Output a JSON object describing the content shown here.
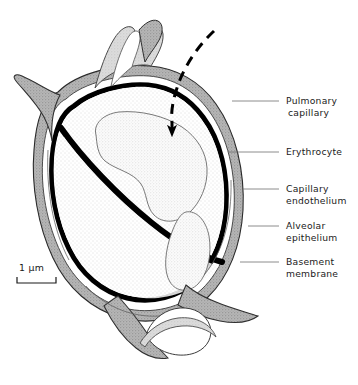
{
  "figure": {
    "kind": "anatomical-diagram",
    "background_color": "#ffffff"
  },
  "colors": {
    "ink": "#111111",
    "basement_membrane": "#000000",
    "tissue_grey": "#a9a9a9",
    "tissue_grey_light": "#c9c9c9",
    "lumen_stipple": "#e9e9e9",
    "erythrocyte_stipple": "#efefef",
    "leader_line": "#6e6e6e",
    "text": "#1a1a1a"
  },
  "labels": [
    {
      "id": "pulmonary-capillary",
      "lines": [
        "Pulmonary",
        "capillary"
      ],
      "text_x": 286,
      "text_y": 104,
      "leader": {
        "x1": 279,
        "y1": 101,
        "x2": 232,
        "y2": 101
      }
    },
    {
      "id": "erythrocyte",
      "lines": [
        "Erythrocyte"
      ],
      "text_x": 286,
      "text_y": 155,
      "leader": {
        "x1": 279,
        "y1": 152,
        "x2": 228,
        "y2": 152
      }
    },
    {
      "id": "capillary-endothelium",
      "lines": [
        "Capillary",
        "endothelium"
      ],
      "text_x": 286,
      "text_y": 192,
      "leader": {
        "x1": 279,
        "y1": 189,
        "x2": 243,
        "y2": 189
      }
    },
    {
      "id": "alveolar-epithelium",
      "lines": [
        "Alveolar",
        "epithelium"
      ],
      "text_x": 286,
      "text_y": 229,
      "leader": {
        "x1": 279,
        "y1": 226,
        "x2": 248,
        "y2": 226
      }
    },
    {
      "id": "basement-membrane",
      "lines": [
        "Basement",
        "membrane"
      ],
      "text_x": 286,
      "text_y": 265,
      "leader": {
        "x1": 279,
        "y1": 262,
        "x2": 240,
        "y2": 262
      }
    }
  ],
  "scale_bar": {
    "label": "1 μm",
    "label_x": 19,
    "label_y": 271,
    "bar_x1": 17,
    "bar_x2": 56,
    "bar_y": 283,
    "tick_height": 6
  },
  "annotations": [
    {
      "id": "diffusion-arrow",
      "description": "dashed curved arrow indicating gas diffusion into the erythrocyte",
      "style": "dashed",
      "head_x": 172,
      "head_y": 130
    }
  ],
  "line_widths": {
    "outline": 1.1,
    "basement_membrane": 5.0,
    "leader": 0.8,
    "dashed_arrow": 3.0
  }
}
